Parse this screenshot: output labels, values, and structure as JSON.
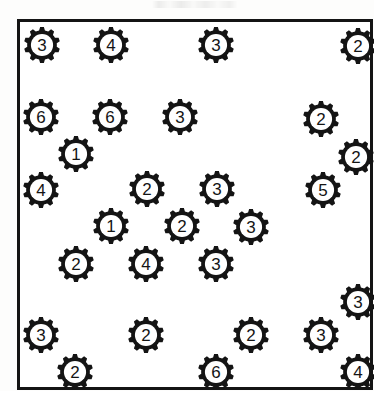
{
  "sheet": {
    "title": "",
    "header_note": "",
    "background_color": "#ffffff",
    "ink_color": "#141414",
    "frame": {
      "x": 17,
      "y": 19,
      "width": 356,
      "height": 371,
      "border_width": 3
    }
  },
  "diagram": {
    "type": "scatter-count-worksheet",
    "icon_name": "gear-icon",
    "icon_description": "cog wheel with ten teeth, thick black ring, white centre bearing a single digit",
    "total_icons": 30,
    "digit_values_present": [
      1,
      2,
      3,
      4,
      5,
      6
    ],
    "digit_counts": {
      "1": 2,
      "2": 10,
      "3": 10,
      "4": 4,
      "5": 1,
      "6": 3
    },
    "gears": [
      {
        "label": "3",
        "x": 39,
        "y": 42,
        "r": 15
      },
      {
        "label": "4",
        "x": 108,
        "y": 42,
        "r": 15
      },
      {
        "label": "3",
        "x": 213,
        "y": 42,
        "r": 15
      },
      {
        "label": "2",
        "x": 355,
        "y": 43,
        "r": 15
      },
      {
        "label": "6",
        "x": 38,
        "y": 114,
        "r": 15
      },
      {
        "label": "6",
        "x": 107,
        "y": 114,
        "r": 15
      },
      {
        "label": "3",
        "x": 177,
        "y": 114,
        "r": 15
      },
      {
        "label": "2",
        "x": 318,
        "y": 116,
        "r": 15
      },
      {
        "label": "1",
        "x": 73,
        "y": 151,
        "r": 15
      },
      {
        "label": "2",
        "x": 353,
        "y": 154,
        "r": 15
      },
      {
        "label": "4",
        "x": 38,
        "y": 187,
        "r": 15
      },
      {
        "label": "2",
        "x": 144,
        "y": 186,
        "r": 15
      },
      {
        "label": "3",
        "x": 214,
        "y": 186,
        "r": 15
      },
      {
        "label": "5",
        "x": 320,
        "y": 187,
        "r": 15
      },
      {
        "label": "1",
        "x": 108,
        "y": 223,
        "r": 15
      },
      {
        "label": "2",
        "x": 179,
        "y": 223,
        "r": 15
      },
      {
        "label": "3",
        "x": 248,
        "y": 224,
        "r": 15
      },
      {
        "label": "2",
        "x": 73,
        "y": 261,
        "r": 15
      },
      {
        "label": "4",
        "x": 143,
        "y": 261,
        "r": 15
      },
      {
        "label": "3",
        "x": 213,
        "y": 261,
        "r": 15
      },
      {
        "label": "3",
        "x": 355,
        "y": 299,
        "r": 15
      },
      {
        "label": "3",
        "x": 38,
        "y": 332,
        "r": 15
      },
      {
        "label": "2",
        "x": 143,
        "y": 332,
        "r": 15
      },
      {
        "label": "2",
        "x": 248,
        "y": 332,
        "r": 15
      },
      {
        "label": "3",
        "x": 318,
        "y": 332,
        "r": 15
      },
      {
        "label": "2",
        "x": 72,
        "y": 369,
        "r": 15
      },
      {
        "label": "6",
        "x": 213,
        "y": 369,
        "r": 15
      },
      {
        "label": "4",
        "x": 355,
        "y": 369,
        "r": 15
      }
    ]
  }
}
